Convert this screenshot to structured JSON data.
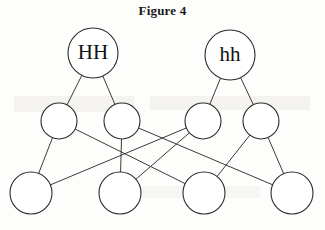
{
  "figure": {
    "title": "Figure 4",
    "type": "pedigree-diagram",
    "background_color": "#fdfdfc",
    "line_color": "#3a3a3a",
    "node_fill": "#ffffff",
    "node_stroke": "#2b2b2b",
    "label_color": "#111111",
    "nodes": [
      {
        "id": "HH",
        "label": "HH",
        "cx": 93,
        "cy": 53,
        "r": 25,
        "row": "top"
      },
      {
        "id": "hh",
        "label": "hh",
        "cx": 230,
        "cy": 55,
        "r": 25,
        "row": "top"
      },
      {
        "id": "M1",
        "label": "",
        "cx": 59,
        "cy": 121,
        "r": 18,
        "row": "middle"
      },
      {
        "id": "M2",
        "label": "",
        "cx": 122,
        "cy": 121,
        "r": 18,
        "row": "middle"
      },
      {
        "id": "M3",
        "label": "",
        "cx": 203,
        "cy": 121,
        "r": 18,
        "row": "middle"
      },
      {
        "id": "M4",
        "label": "",
        "cx": 261,
        "cy": 121,
        "r": 18,
        "row": "middle"
      },
      {
        "id": "B1",
        "label": "",
        "cx": 31,
        "cy": 193,
        "r": 21,
        "row": "bottom"
      },
      {
        "id": "B2",
        "label": "",
        "cx": 120,
        "cy": 193,
        "r": 21,
        "row": "bottom"
      },
      {
        "id": "B3",
        "label": "",
        "cx": 204,
        "cy": 193,
        "r": 21,
        "row": "bottom"
      },
      {
        "id": "B4",
        "label": "",
        "cx": 292,
        "cy": 193,
        "r": 21,
        "row": "bottom"
      }
    ],
    "edges": [
      {
        "from": "HH",
        "to": "M1"
      },
      {
        "from": "HH",
        "to": "M2"
      },
      {
        "from": "hh",
        "to": "M3"
      },
      {
        "from": "hh",
        "to": "M4"
      },
      {
        "from": "M1",
        "to": "B1"
      },
      {
        "from": "M1",
        "to": "B3"
      },
      {
        "from": "M2",
        "to": "B2"
      },
      {
        "from": "M2",
        "to": "B4"
      },
      {
        "from": "M3",
        "to": "B1"
      },
      {
        "from": "M3",
        "to": "B2"
      },
      {
        "from": "M4",
        "to": "B3"
      },
      {
        "from": "M4",
        "to": "B4"
      }
    ]
  }
}
